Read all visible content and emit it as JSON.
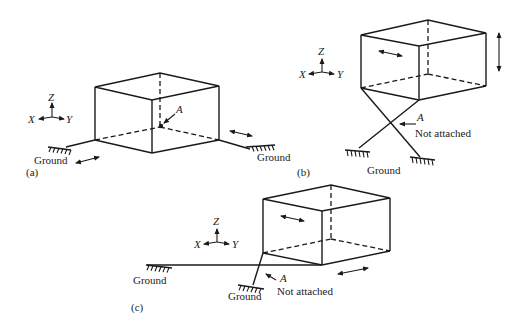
{
  "figure": {
    "panels": [
      {
        "id": "a",
        "label": "(a)",
        "axes": {
          "z": "Z",
          "x": "X",
          "y": "Y"
        },
        "point_label": "A",
        "ground_left": "Ground",
        "ground_right": "Ground"
      },
      {
        "id": "b",
        "label": "(b)",
        "axes": {
          "z": "Z",
          "x": "X",
          "y": "Y"
        },
        "point_label": "A",
        "note": "Not attached",
        "ground": "Ground"
      },
      {
        "id": "c",
        "label": "(c)",
        "axes": {
          "z": "Z",
          "x": "X",
          "y": "Y"
        },
        "point_label": "A",
        "note": "Not attached",
        "ground_left": "Ground",
        "ground_right": "Ground"
      }
    ]
  }
}
